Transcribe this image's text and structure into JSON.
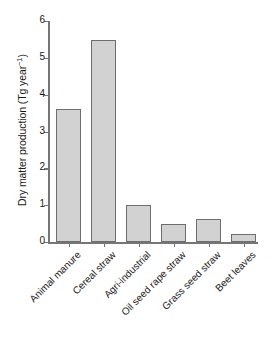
{
  "chart_data": {
    "type": "bar",
    "title": "",
    "xlabel": "",
    "ylabel": "Dry matter production (Tg year",
    "ylabel_sup": "−1",
    "ylabel_tail": ")",
    "ylabel_full": "Dry matter production (Tg year⁻¹)",
    "categories": [
      "Animal manure",
      "Cereal straw",
      "Agri-industrial",
      "Oil seed rape straw",
      "Grass seed straw",
      "Beet leaves"
    ],
    "values": [
      3.62,
      5.48,
      1.0,
      0.48,
      0.62,
      0.22
    ],
    "ylim": [
      0,
      6
    ],
    "yticks": [
      0,
      1,
      2,
      3,
      4,
      5,
      6
    ],
    "ytick_labels": [
      "0",
      "1",
      "2",
      "3",
      "4",
      "5",
      "6"
    ],
    "grid": false,
    "legend": "none",
    "bar_fill_color": "#d2d2d2",
    "bar_edge_color": "#6e6e6e",
    "axis_color": "#767676",
    "background_color": "#ffffff"
  }
}
